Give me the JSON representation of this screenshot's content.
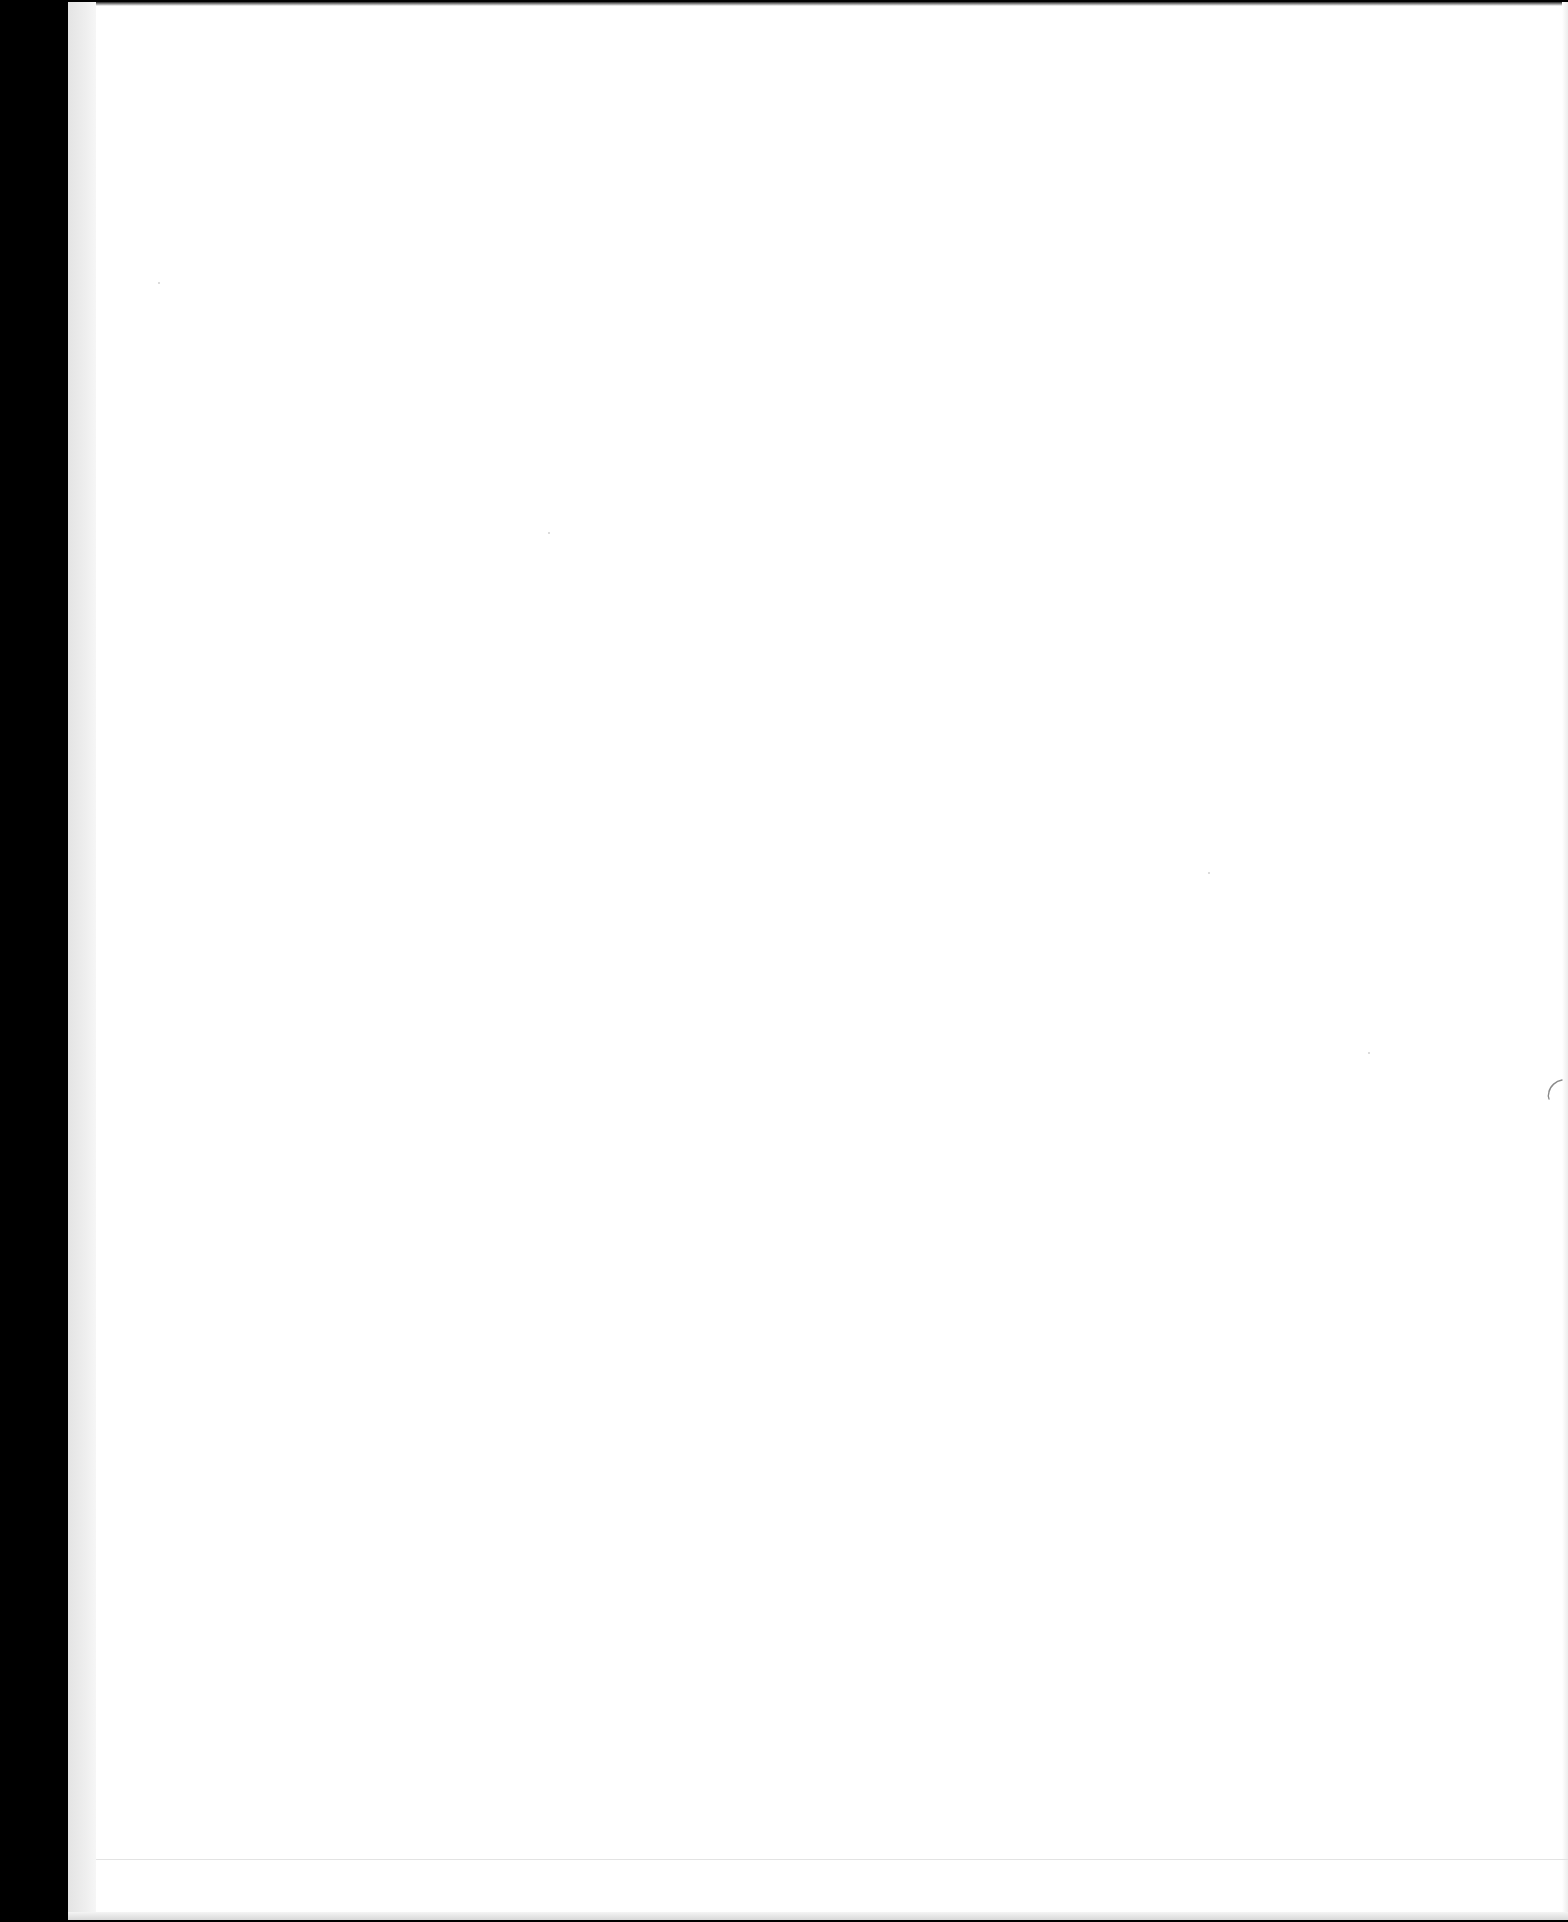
{
  "document": {
    "type": "scanned-page",
    "content": "",
    "is_blank": true
  },
  "colors": {
    "page": "#ffffff",
    "margin": "#000000",
    "spine_strip": "#eeeeee",
    "rule_line": "#e3e3e3"
  }
}
